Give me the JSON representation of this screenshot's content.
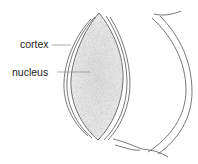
{
  "diagram": {
    "labels": [
      {
        "id": "cortex",
        "text": "cortex",
        "x": 20,
        "y": 39
      },
      {
        "id": "nucleus",
        "text": "nucleus",
        "x": 12,
        "y": 67
      }
    ],
    "colors": {
      "stroke": "#555555",
      "fill": "#e9e9e9",
      "text": "#222222",
      "leader": "#888888"
    }
  }
}
